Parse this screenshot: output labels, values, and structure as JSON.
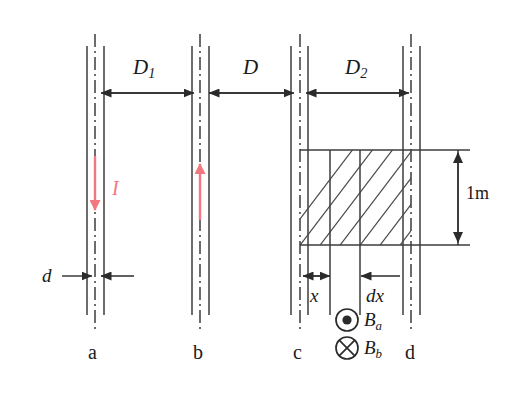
{
  "figure": {
    "type": "physics-diagram",
    "background": "#ffffff",
    "line_color": "#3c3c3c",
    "current_color": "#f1787f"
  },
  "conductors": [
    {
      "id": "a",
      "label": "a",
      "x": 95,
      "current_label": "I",
      "current_direction": "down"
    },
    {
      "id": "b",
      "label": "b",
      "x": 200,
      "current_label": "I",
      "current_direction": "up"
    },
    {
      "id": "c",
      "label": "c",
      "x": 300,
      "current_direction": "none"
    },
    {
      "id": "d",
      "label": "d",
      "x": 411,
      "current_direction": "none"
    }
  ],
  "dimensions": {
    "horizontal": [
      {
        "name": "D1",
        "label": "D",
        "subscript": "1",
        "from": "a",
        "to": "b"
      },
      {
        "name": "D",
        "label": "D",
        "subscript": "",
        "from": "b",
        "to": "c"
      },
      {
        "name": "D2",
        "label": "D",
        "subscript": "2",
        "from": "c",
        "to": "d"
      }
    ],
    "thickness": {
      "label": "d",
      "target": "a"
    },
    "vertical": {
      "label": "1m",
      "value": 1,
      "unit": "m"
    },
    "element": [
      {
        "label": "x",
        "italic": true,
        "from": "c",
        "to": "element-left"
      },
      {
        "label": "dx",
        "italic": true,
        "description": "differential strip width"
      }
    ]
  },
  "field_symbols": [
    {
      "label": "B",
      "subscript": "a",
      "glyph": "dot-in-circle",
      "meaning": "out of page"
    },
    {
      "label": "B",
      "subscript": "b",
      "glyph": "cross-in-circle",
      "meaning": "into page"
    }
  ],
  "hatched_region": {
    "description": "area element between conductors c and d",
    "hatch_direction": "lower-left to upper-right",
    "height_label": "1m"
  }
}
